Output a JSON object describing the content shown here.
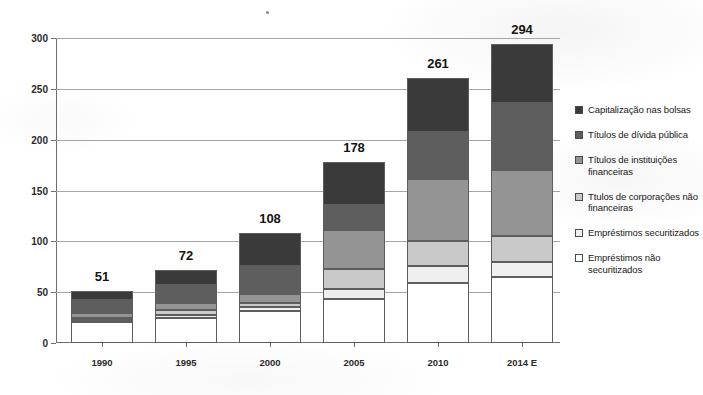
{
  "chart_data": {
    "type": "bar",
    "subtype": "stacked-bar",
    "title": "",
    "subtitle": "",
    "xlabel": "",
    "ylabel": "",
    "categories": [
      "1990",
      "1995",
      "2000",
      "2005",
      "2010",
      "2014 E"
    ],
    "totals": [
      51,
      72,
      108,
      178,
      261,
      294
    ],
    "ylim": [
      0,
      300
    ],
    "ytick_step": 50,
    "yticks": [
      0,
      50,
      100,
      150,
      200,
      250,
      300
    ],
    "grid": true,
    "legend_position": "right",
    "series": [
      {
        "name": "Empréstimos não securitizados",
        "color": "#ffffff",
        "values": [
          21,
          25,
          31,
          43,
          59,
          65
        ]
      },
      {
        "name": "Empréstimos securitizados",
        "color": "#efefef",
        "values": [
          2,
          3,
          4,
          10,
          17,
          15
        ]
      },
      {
        "name": "Ttulos de corporações não financeiras",
        "color": "#c9c9c9",
        "values": [
          2,
          4,
          4,
          20,
          24,
          25
        ]
      },
      {
        "name": "Títulos de instituições financeiras",
        "color": "#949494",
        "values": [
          5,
          7,
          9,
          38,
          61,
          65
        ]
      },
      {
        "name": "Títulos de dívida pública",
        "color": "#5e5e5e",
        "values": [
          12,
          18,
          28,
          25,
          47,
          66
        ]
      },
      {
        "name": "Capitalização nas bolsas",
        "color": "#3a3a3a",
        "values": [
          9,
          15,
          32,
          42,
          53,
          58
        ]
      }
    ]
  },
  "axis": {
    "y_tick_labels": [
      "0",
      "50",
      "100",
      "150",
      "200",
      "250",
      "300"
    ],
    "x_tick_labels": [
      "1990",
      "1995",
      "2000",
      "2005",
      "2010",
      "2014 E"
    ]
  },
  "bar_labels": [
    "51",
    "72",
    "108",
    "178",
    "261",
    "294"
  ],
  "legend": {
    "items": [
      {
        "label": "Capitalização nas bolsas",
        "color": "#3a3a3a"
      },
      {
        "label": "Títulos de dívida pública",
        "color": "#5e5e5e"
      },
      {
        "label": "Títulos de instituições financeiras",
        "color": "#949494"
      },
      {
        "label": "Ttulos de corporações não financeiras",
        "color": "#c9c9c9"
      },
      {
        "label": "Empréstimos securitizados",
        "color": "#efefef"
      },
      {
        "label": "Empréstimos não securitizados",
        "color": "#ffffff"
      }
    ]
  }
}
